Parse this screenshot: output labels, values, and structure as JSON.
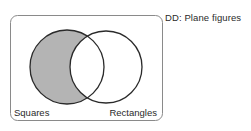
{
  "diagram": {
    "universe_label": "DD:  Plane figures",
    "sets": [
      {
        "name": "Squares",
        "shaded": true,
        "shaded_region": "only-squares"
      },
      {
        "name": "Rectangles",
        "shaded": false
      }
    ],
    "colors": {
      "shade": "#b4b4b4",
      "stroke": "#2a2a2a",
      "frame": "#8a8a8a"
    }
  }
}
